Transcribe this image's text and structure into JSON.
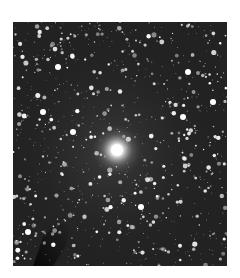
{
  "image": {
    "subject": "star field with bright central star",
    "alt": "Astronomical image of a dense star field with a bright star near the center and a dark dust lane in the lower left",
    "colors": {
      "background": "#ffffff",
      "sky": "#1a1a1a",
      "star": "#ffffff"
    }
  }
}
